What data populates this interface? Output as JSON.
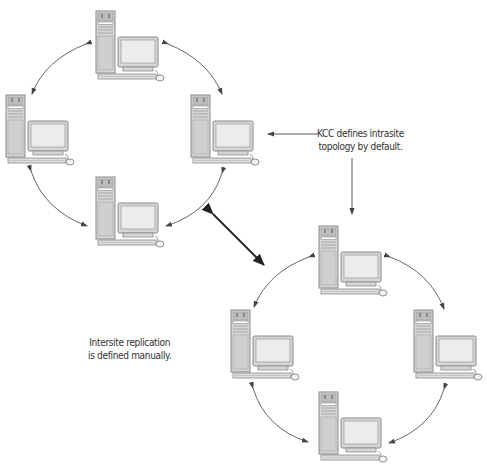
{
  "diagram": {
    "type": "network-topology",
    "sites": [
      {
        "name": "site-1",
        "topology": "ring",
        "computers": [
          {
            "id": "s1-top",
            "x": 95,
            "y": 10
          },
          {
            "id": "s1-right",
            "x": 190,
            "y": 94
          },
          {
            "id": "s1-bottom",
            "x": 95,
            "y": 176
          },
          {
            "id": "s1-left",
            "x": 5,
            "y": 94
          }
        ]
      },
      {
        "name": "site-2",
        "topology": "ring",
        "computers": [
          {
            "id": "s2-top",
            "x": 318,
            "y": 225
          },
          {
            "id": "s2-right",
            "x": 413,
            "y": 309
          },
          {
            "id": "s2-bottom",
            "x": 318,
            "y": 391
          },
          {
            "id": "s2-left",
            "x": 230,
            "y": 309
          }
        ]
      }
    ],
    "annotations": {
      "kcc_line1": "KCC defines intrasite",
      "kcc_line2": "topology by default.",
      "intersite_line1": "Intersite replication",
      "intersite_line2": "is defined manually."
    },
    "colors": {
      "case_fill": "#d6d6d6",
      "case_stroke": "#8a8a8a",
      "screen_fill": "#ececec",
      "arrow": "#333333"
    }
  }
}
